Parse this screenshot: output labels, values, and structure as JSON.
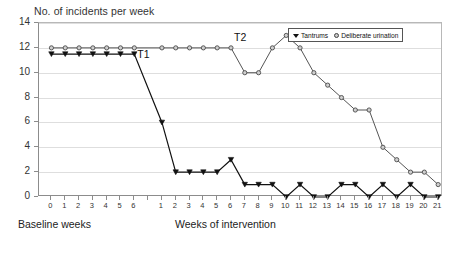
{
  "chart_data": {
    "type": "line",
    "title": "No. of incidents per week",
    "xlabel": "",
    "ylabel": "",
    "ylim": [
      0,
      14
    ],
    "ytick_step": 2,
    "yticks": [
      0,
      2,
      4,
      6,
      8,
      10,
      12,
      14
    ],
    "grid": true,
    "legend_position": "top-right",
    "phases": [
      {
        "name": "Baseline weeks",
        "ticks": [
          "0",
          "1",
          "2",
          "3",
          "4",
          "5",
          "6"
        ]
      },
      {
        "name": "Weeks of intervention",
        "ticks": [
          "1",
          "2",
          "3",
          "4",
          "5",
          "6",
          "7",
          "8",
          "9",
          "10",
          "11",
          "12",
          "13",
          "14",
          "15",
          "16",
          "17",
          "18",
          "19",
          "20",
          "21"
        ]
      }
    ],
    "annotations": [
      {
        "label": "T1",
        "phase": "baseline",
        "week": 6,
        "value": 11.5
      },
      {
        "label": "T2",
        "phase": "intervention",
        "week": 6,
        "value": 12
      }
    ],
    "series": [
      {
        "name": "Tantrums",
        "marker": "triangle",
        "color": "#111111",
        "baseline": [
          11.5,
          11.5,
          11.5,
          11.5,
          11.5,
          11.5,
          11.5
        ],
        "intervention": [
          6,
          2,
          2,
          2,
          2,
          3,
          1,
          1,
          1,
          0,
          1,
          0,
          0,
          1,
          1,
          0,
          1,
          0,
          1,
          0,
          0
        ]
      },
      {
        "name": "Deliberate urination",
        "marker": "circle",
        "color": "#555555",
        "baseline": [
          12,
          12,
          12,
          12,
          12,
          12,
          12
        ],
        "intervention": [
          12,
          12,
          12,
          12,
          12,
          12,
          10,
          10,
          12,
          13,
          12,
          10,
          9,
          8,
          7,
          7,
          4,
          3,
          2,
          2,
          1
        ]
      }
    ]
  },
  "legend": {
    "items": [
      {
        "label": "Tantrums",
        "marker": "triangle"
      },
      {
        "label": "Deliberate urination",
        "marker": "circle"
      }
    ]
  },
  "captions": {
    "baseline": "Baseline weeks",
    "intervention": "Weeks of intervention"
  }
}
